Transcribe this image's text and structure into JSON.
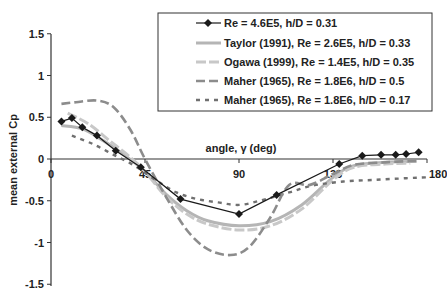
{
  "chart_data": {
    "type": "line",
    "title": "",
    "xlabel": "angle, γ (deg)",
    "ylabel": "mean external Cp",
    "xlim": [
      0,
      180
    ],
    "ylim": [
      -1.5,
      1.5
    ],
    "x_ticks": [
      0,
      45,
      90,
      135,
      180
    ],
    "x_tick_labels": [
      "0",
      "45",
      "90",
      "135",
      "180"
    ],
    "y_ticks": [
      1.5,
      1,
      0.5,
      0,
      -0.5,
      -1,
      -1.5
    ],
    "y_tick_labels": [
      "1.5",
      "1",
      "0.5",
      "0",
      "-0.5",
      "-1",
      "-1.5"
    ],
    "grid": false,
    "legend_position": "upper right (boxed)",
    "series": [
      {
        "name": "Re = 4.6E5, h/D = 0.31",
        "style": "solid-marker",
        "color": "#1a1a1a",
        "x": [
          5,
          10,
          15,
          22,
          31,
          43,
          62,
          90,
          108,
          138,
          149,
          158,
          165,
          170,
          176
        ],
        "y": [
          0.45,
          0.49,
          0.38,
          0.28,
          0.1,
          -0.1,
          -0.48,
          -0.66,
          -0.43,
          -0.06,
          0.04,
          0.05,
          0.05,
          0.06,
          0.08
        ]
      },
      {
        "name": "Taylor (1991), Re = 2.6E5, h/D = 0.33",
        "style": "solid-thick",
        "color": "#b5b5b5",
        "x": [
          5,
          15,
          25,
          35,
          45,
          55,
          65,
          75,
          90,
          105,
          120,
          135,
          145,
          160,
          175
        ],
        "y": [
          0.4,
          0.36,
          0.22,
          0.05,
          -0.15,
          -0.42,
          -0.62,
          -0.74,
          -0.8,
          -0.75,
          -0.55,
          -0.22,
          -0.08,
          -0.04,
          -0.03
        ]
      },
      {
        "name": "Ogawa (1999), Re = 1.4E5, h/D = 0.35",
        "style": "dash-thick",
        "color": "#c8c8c8",
        "x": [
          8,
          18,
          28,
          38,
          45,
          55,
          65,
          75,
          90,
          105,
          120,
          135,
          145,
          160,
          172
        ],
        "y": [
          0.55,
          0.42,
          0.22,
          0.02,
          -0.15,
          -0.45,
          -0.66,
          -0.78,
          -0.85,
          -0.8,
          -0.6,
          -0.25,
          -0.1,
          -0.06,
          -0.05
        ]
      },
      {
        "name": "Maher (1965), Re = 1.8E6, h/D = 0.5",
        "style": "long-dash",
        "color": "#8c8c8c",
        "x": [
          5,
          12,
          22,
          30,
          38,
          45,
          55,
          65,
          75,
          86,
          95,
          105,
          114,
          124,
          135,
          145,
          160,
          175
        ],
        "y": [
          0.66,
          0.68,
          0.7,
          0.62,
          0.35,
          0.0,
          -0.45,
          -0.85,
          -1.08,
          -1.15,
          -1.05,
          -0.7,
          -0.31,
          -0.31,
          -0.18,
          -0.07,
          -0.04,
          -0.02
        ]
      },
      {
        "name": "Maher (1965), Re = 1.8E6, h/D = 0.17",
        "style": "dotted-dash",
        "color": "#707070",
        "x": [
          10,
          20,
          30,
          40,
          50,
          60,
          70,
          80,
          90,
          100,
          114,
          125,
          140,
          155,
          170,
          180
        ],
        "y": [
          0.28,
          0.18,
          0.05,
          -0.08,
          -0.25,
          -0.4,
          -0.48,
          -0.52,
          -0.55,
          -0.5,
          -0.4,
          -0.32,
          -0.27,
          -0.25,
          -0.23,
          -0.22
        ]
      }
    ]
  },
  "legend": {
    "items": [
      "Re = 4.6E5, h/D = 0.31",
      "Taylor (1991), Re = 2.6E5, h/D = 0.33",
      "Ogawa (1999), Re = 1.4E5, h/D = 0.35",
      "Maher (1965), Re = 1.8E6, h/D = 0.5",
      "Maher (1965), Re = 1.8E6, h/D = 0.17"
    ]
  },
  "axes": {
    "xlabel": "angle, γ (deg)",
    "ylabel": "mean external Cp"
  }
}
